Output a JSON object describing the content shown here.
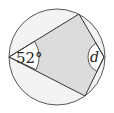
{
  "diagram": {
    "type": "cyclic-quadrilateral",
    "circle": {
      "cx": 57,
      "cy": 57,
      "r": 48
    },
    "vertices": {
      "left": {
        "x": 9,
        "y": 57
      },
      "top": {
        "x": 79,
        "y": 14
      },
      "right": {
        "x": 104,
        "y": 57
      },
      "bottom": {
        "x": 85,
        "y": 96
      }
    },
    "angles": {
      "left": {
        "label": "52°",
        "value": 52,
        "unit": "degrees"
      },
      "right": {
        "label": "d",
        "value": null,
        "unknown": true
      }
    },
    "colors": {
      "stroke": "#333333",
      "quad_fill": "#dcdcdc",
      "segment_fill": "#f3f3f3",
      "angle_fill": "#ffffff"
    }
  }
}
